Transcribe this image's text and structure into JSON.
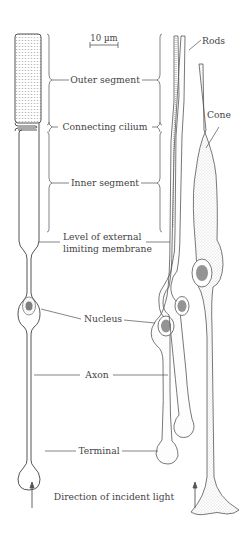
{
  "figure": {
    "type": "anatomical diagram",
    "colors": {
      "ink": "#444444",
      "line": "#555555",
      "stipple": "#888888",
      "background": "#ffffff"
    }
  },
  "scale_bar": {
    "label": "10 µm"
  },
  "labels": {
    "outer_segment": "Outer segment",
    "connecting_cilium": "Connecting cilium",
    "inner_segment": "Inner segment",
    "elm_line1": "Level of external",
    "elm_line2": "limiting membrane",
    "nucleus": "Nucleus",
    "axon": "Axon",
    "terminal": "Terminal"
  },
  "cell_labels": {
    "rods": "Rods",
    "cone": "Cone"
  },
  "caption": {
    "direction": "Direction of incident light"
  },
  "icons": {
    "left_arrow": "up-arrow",
    "right_arrow": "up-arrow"
  }
}
